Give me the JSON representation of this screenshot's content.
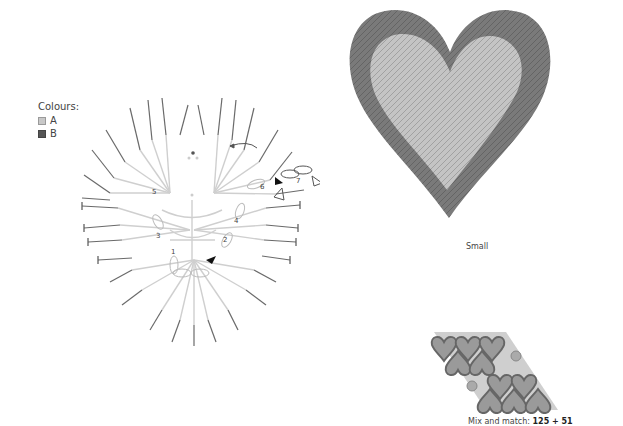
{
  "legend": {
    "title": "Colours:",
    "items": [
      {
        "key": "A",
        "color": "#c8c8c8"
      },
      {
        "key": "B",
        "color": "#555555"
      }
    ]
  },
  "chart": {
    "round_numbers": [
      "1",
      "2",
      "3",
      "4",
      "5",
      "6",
      "7"
    ],
    "colors": {
      "light": "#cfcfcf",
      "dark": "#6a6a6a"
    }
  },
  "photo": {
    "caption": "Small",
    "colors": {
      "outer": "#7a7a7a",
      "inner": "#c4c4c4"
    }
  },
  "mix_match": {
    "label": "Mix and match:",
    "value": "125 + 51"
  }
}
